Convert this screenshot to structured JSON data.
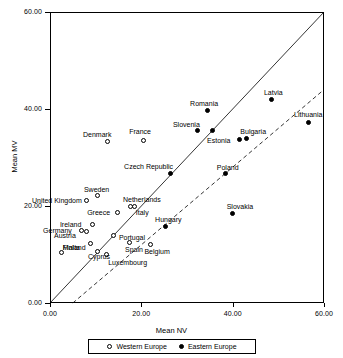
{
  "chart_data": {
    "type": "scatter",
    "title": "",
    "xlabel": "Mean NV",
    "ylabel": "Mean MV",
    "xlim": [
      0,
      60
    ],
    "ylim": [
      0,
      60
    ],
    "xticks": [
      "0.00",
      "20.00",
      "40.00",
      "60.00"
    ],
    "yticks": [
      "0.00",
      "20.00",
      "40.00",
      "60.00"
    ],
    "grid": false,
    "legend_position": "bottom",
    "legend": [
      {
        "label": "Western Europe",
        "marker": "open-circle"
      },
      {
        "label": "Eastern Europe",
        "marker": "filled-circle"
      }
    ],
    "reference_lines": [
      {
        "name": "identity-line",
        "style": "solid",
        "from": [
          0,
          0
        ],
        "to": [
          60,
          60
        ]
      },
      {
        "name": "regression-line",
        "style": "dashed",
        "from": [
          5.0,
          0.0
        ],
        "to": [
          60.0,
          44.0
        ]
      }
    ],
    "series": [
      {
        "name": "Western Europe",
        "marker": "open-circle",
        "points": [
          {
            "label": "Denmark",
            "x": 12.7,
            "y": 33.2,
            "label_dx": -25,
            "label_dy": -11
          },
          {
            "label": "France",
            "x": 20.4,
            "y": 33.6,
            "label_dx": -14,
            "label_dy": -12
          },
          {
            "label": "Sweden",
            "x": 10.5,
            "y": 22.1,
            "label_dx": -14,
            "label_dy": -10
          },
          {
            "label": "United Kingdom",
            "x": 8.1,
            "y": 21.2,
            "label_dx": -55,
            "label_dy": -3
          },
          {
            "label": "Netherlands",
            "x": 18.6,
            "y": 20.0,
            "label_dx": -12,
            "label_dy": -10
          },
          {
            "label": "Ireland",
            "x": 9.4,
            "y": 16.1,
            "label_dx": -33,
            "label_dy": -4
          },
          {
            "label": "Greece",
            "x": 14.7,
            "y": 18.6,
            "label_dx": -30,
            "label_dy": -4
          },
          {
            "label": "Italy",
            "x": 17.7,
            "y": 19.8,
            "label_dx": 5,
            "label_dy": 2
          },
          {
            "label": "Germany",
            "x": 6.8,
            "y": 15.0,
            "label_dx": -38,
            "label_dy": -3
          },
          {
            "label": "Austria",
            "x": 8.1,
            "y": 14.8,
            "label_dx": -33,
            "label_dy": 1
          },
          {
            "label": "Portugal",
            "x": 14.0,
            "y": 14.0,
            "label_dx": 5,
            "label_dy": -1
          },
          {
            "label": "Finland",
            "x": 8.9,
            "y": 12.2,
            "label_dx": -28,
            "label_dy": 0
          },
          {
            "label": "Spain",
            "x": 17.3,
            "y": 12.4,
            "label_dx": -4,
            "label_dy": 3
          },
          {
            "label": "Malta",
            "x": 2.6,
            "y": 10.5,
            "label_dx": 1,
            "label_dy": -8
          },
          {
            "label": "Cyprus",
            "x": 10.5,
            "y": 10.7,
            "label_dx": -10,
            "label_dy": 2
          },
          {
            "label": "Luxembourg",
            "x": 12.3,
            "y": 9.9,
            "label_dx": 2,
            "label_dy": 4
          },
          {
            "label": "Belgium",
            "x": 22.0,
            "y": 12.0,
            "label_dx": -6,
            "label_dy": 3
          }
        ]
      },
      {
        "name": "Eastern Europe",
        "marker": "filled-circle",
        "points": [
          {
            "label": "Latvia",
            "x": 48.6,
            "y": 41.9,
            "label_dx": -8,
            "label_dy": -11
          },
          {
            "label": "Lithuania",
            "x": 56.5,
            "y": 37.3,
            "label_dx": -14,
            "label_dy": -11
          },
          {
            "label": "Romania",
            "x": 34.4,
            "y": 39.6,
            "label_dx": -17,
            "label_dy": -11
          },
          {
            "label": "Slovenia",
            "x": 32.4,
            "y": 35.5,
            "label_dx": -25,
            "label_dy": -10
          },
          {
            "label": "Slovenia2",
            "x": 35.5,
            "y": 35.5,
            "label_dx": 0,
            "label_dy": 0
          },
          {
            "label": "Estonia",
            "x": 41.4,
            "y": 33.8,
            "label_dx": -32,
            "label_dy": -2
          },
          {
            "label": "Bulgaria",
            "x": 43.0,
            "y": 34.0,
            "label_dx": -6,
            "label_dy": -10
          },
          {
            "label": "Czech Republic",
            "x": 26.3,
            "y": 26.8,
            "label_dx": -46,
            "label_dy": -10
          },
          {
            "label": "Poland",
            "x": 38.5,
            "y": 26.6,
            "label_dx": -9,
            "label_dy": -10
          },
          {
            "label": "Slovakia",
            "x": 40.0,
            "y": 18.4,
            "label_dx": -6,
            "label_dy": -11
          },
          {
            "label": "Hungary",
            "x": 25.2,
            "y": 15.7,
            "label_dx": -10,
            "label_dy": -11
          }
        ]
      }
    ]
  }
}
